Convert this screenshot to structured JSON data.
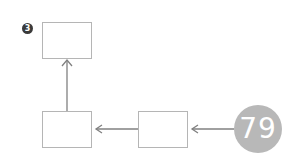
{
  "diagram": {
    "step_badge": "3",
    "counter_value": "79",
    "colors": {
      "box_border": "#b5b5b5",
      "arrow": "#808080",
      "badge_bg": "#3a3a3a",
      "circle_bg": "#b8b8b8"
    },
    "nodes": [
      {
        "id": "top-box",
        "label": ""
      },
      {
        "id": "bottom-left-box",
        "label": ""
      },
      {
        "id": "bottom-middle-box",
        "label": ""
      },
      {
        "id": "counter-circle",
        "label": "79"
      }
    ],
    "edges": [
      {
        "from": "counter-circle",
        "to": "bottom-middle-box"
      },
      {
        "from": "bottom-middle-box",
        "to": "bottom-left-box"
      },
      {
        "from": "bottom-left-box",
        "to": "top-box"
      }
    ]
  }
}
